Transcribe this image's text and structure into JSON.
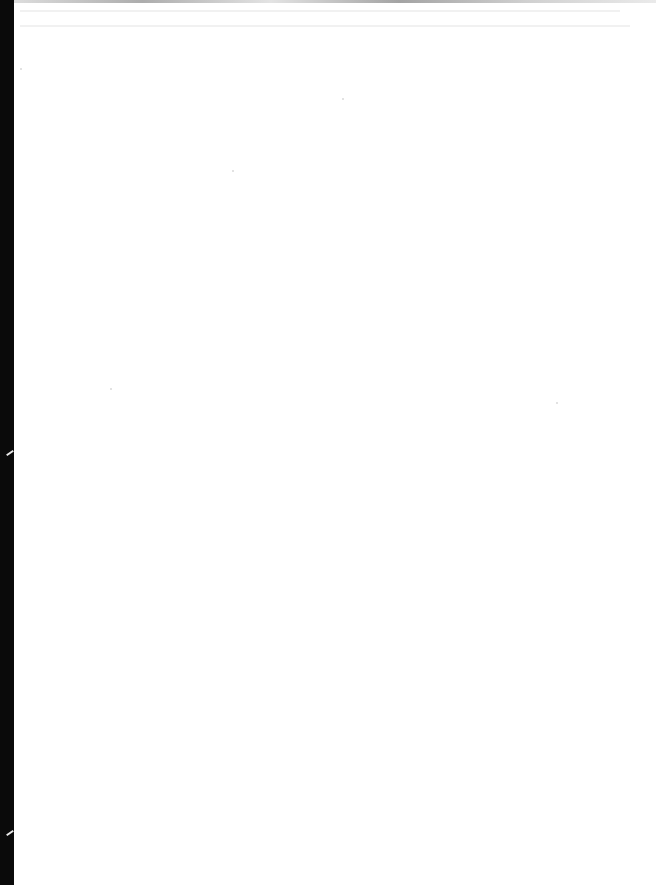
{
  "document": {
    "type": "scanned-page",
    "content": "",
    "state": "blank page"
  },
  "colors": {
    "page": "#ffffff",
    "scan_edge": "#0a0a0a"
  }
}
